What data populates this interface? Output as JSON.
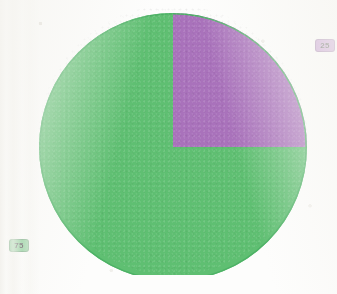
{
  "background_color": "#fdfdfc",
  "chart_data": {
    "type": "pie",
    "title": "",
    "subtitle": "",
    "xlabel": "",
    "ylabel": "",
    "grid": false,
    "legend_position": "none",
    "start_angle_deg": 0,
    "direction": "clockwise",
    "total": 100,
    "units": "percent",
    "categories": [
      "75",
      "25"
    ],
    "values": [
      75,
      25
    ],
    "colors": [
      "#5fbf72",
      "#a972bb"
    ],
    "slices": [
      {
        "name": "green-slice",
        "label": "75",
        "value": 75,
        "percent": 75,
        "color": "#5fbf72",
        "start_angle_deg": 90,
        "end_angle_deg": 360,
        "label_color": "#79c78a",
        "label_position": "outside-left"
      },
      {
        "name": "purple-slice",
        "label": "25",
        "value": 25,
        "percent": 25,
        "color": "#a972bb",
        "start_angle_deg": 0,
        "end_angle_deg": 90,
        "label_color": "#bb8ccb",
        "label_position": "outside-right"
      }
    ],
    "geometry": {
      "center_x": 135,
      "center_y": 142,
      "radius": 134,
      "outline_color": "#4eb266",
      "outline_width": 1.5
    }
  }
}
